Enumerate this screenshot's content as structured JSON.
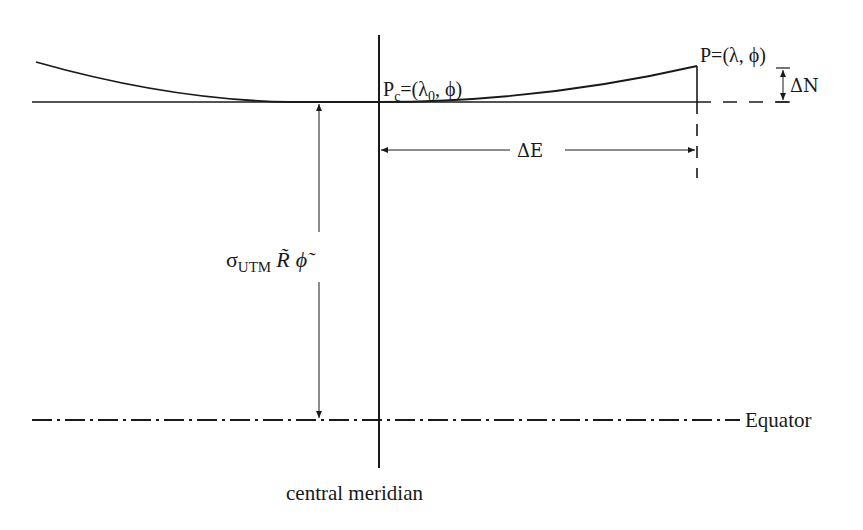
{
  "diagram": {
    "labels": {
      "pc_label_main": "P",
      "pc_label_sub": "c",
      "pc_label_rest": "=(λ",
      "pc_label_sub0": "0",
      "pc_label_end": ", ϕ)",
      "p_label": "P=(λ, ϕ)",
      "delta_n": "ΔN",
      "delta_e": "ΔE",
      "sigma": "σ",
      "sigma_sub": "UTM",
      "r_tilde": "R̃",
      "phi_tilde": "ϕ̃",
      "equator": "Equator",
      "central_meridian": "central meridian"
    },
    "colors": {
      "line": "#1a1a1a",
      "background": "#ffffff"
    }
  }
}
